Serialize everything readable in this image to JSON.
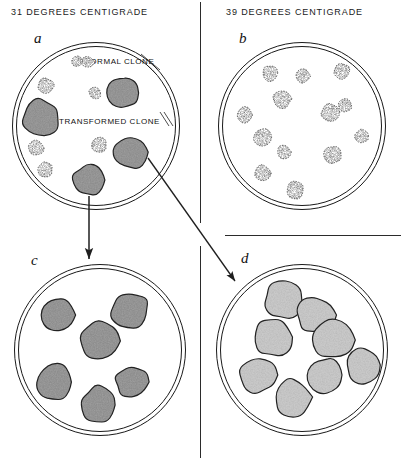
{
  "figure": {
    "type": "scientific-diagram",
    "headings": {
      "left": "31 DEGREES CENTIGRADE",
      "right": "39 DEGREES CENTIGRADE"
    },
    "labels": {
      "normal_clone": "NORMAL CLONE",
      "transformed_clone": "TRANSFORMED CLONE"
    },
    "colors": {
      "ink": "#1a1a1a",
      "background": "#ffffff",
      "colony_fill_dark": "#8d8d8d",
      "colony_fill_light": "#c9c9c9",
      "colony_outline": "#222222"
    },
    "panels": [
      {
        "id": "a",
        "letter": "a",
        "temperature": "31 DEGREES CENTIGRADE",
        "position": "top-left",
        "description": "Dish at permissive temperature containing both small normal clones and large dark transformed clones",
        "normal_clone_count": 6,
        "transformed_clone_count": 4,
        "colonies": [
          {
            "kind": "normal",
            "cx": 46,
            "cy": 86,
            "r": 8
          },
          {
            "kind": "normal",
            "cx": 95,
            "cy": 93,
            "r": 6
          },
          {
            "kind": "transformed",
            "cx": 122,
            "cy": 93,
            "r": 16
          },
          {
            "kind": "transformed",
            "cx": 41,
            "cy": 118,
            "r": 19
          },
          {
            "kind": "normal",
            "cx": 36,
            "cy": 148,
            "r": 8
          },
          {
            "kind": "normal",
            "cx": 99,
            "cy": 145,
            "r": 8
          },
          {
            "kind": "transformed",
            "cx": 131,
            "cy": 152,
            "r": 17
          },
          {
            "kind": "normal",
            "cx": 45,
            "cy": 170,
            "r": 8
          },
          {
            "kind": "transformed",
            "cx": 89,
            "cy": 180,
            "r": 16
          },
          {
            "kind": "normal",
            "cx": 88,
            "cy": 62,
            "r": 6
          }
        ]
      },
      {
        "id": "b",
        "letter": "b",
        "temperature": "39 DEGREES CENTIGRADE",
        "position": "top-right",
        "description": "Dish at non-permissive temperature containing only small normal clones; no transformed clones grow",
        "normal_clone_count": 13,
        "transformed_clone_count": 0,
        "colonies": [
          {
            "kind": "normal",
            "cx": 270,
            "cy": 73,
            "r": 8
          },
          {
            "kind": "normal",
            "cx": 303,
            "cy": 76,
            "r": 7
          },
          {
            "kind": "normal",
            "cx": 342,
            "cy": 71,
            "r": 8
          },
          {
            "kind": "normal",
            "cx": 282,
            "cy": 99,
            "r": 9
          },
          {
            "kind": "normal",
            "cx": 245,
            "cy": 115,
            "r": 8
          },
          {
            "kind": "normal",
            "cx": 330,
            "cy": 112,
            "r": 9
          },
          {
            "kind": "normal",
            "cx": 345,
            "cy": 105,
            "r": 7
          },
          {
            "kind": "normal",
            "cx": 262,
            "cy": 137,
            "r": 9
          },
          {
            "kind": "normal",
            "cx": 362,
            "cy": 136,
            "r": 7
          },
          {
            "kind": "normal",
            "cx": 284,
            "cy": 152,
            "r": 7
          },
          {
            "kind": "normal",
            "cx": 333,
            "cy": 155,
            "r": 9
          },
          {
            "kind": "normal",
            "cx": 263,
            "cy": 173,
            "r": 8
          },
          {
            "kind": "normal",
            "cx": 295,
            "cy": 190,
            "r": 9
          }
        ]
      },
      {
        "id": "c",
        "letter": "c",
        "temperature": "31 DEGREES CENTIGRADE",
        "position": "bottom-left",
        "description": "Subclone of a transformed colony re-plated at permissive temperature; all colonies are transformed",
        "normal_clone_count": 0,
        "transformed_clone_count": 6,
        "colonies": [
          {
            "kind": "transformed",
            "cx": 58,
            "cy": 315,
            "r": 17
          },
          {
            "kind": "transformed",
            "cx": 130,
            "cy": 310,
            "r": 19
          },
          {
            "kind": "transformed",
            "cx": 100,
            "cy": 341,
            "r": 20
          },
          {
            "kind": "transformed",
            "cx": 55,
            "cy": 382,
            "r": 19
          },
          {
            "kind": "transformed",
            "cx": 132,
            "cy": 382,
            "r": 17
          },
          {
            "kind": "transformed",
            "cx": 99,
            "cy": 405,
            "r": 19
          }
        ]
      },
      {
        "id": "d",
        "letter": "d",
        "temperature": "39 DEGREES CENTIGRADE",
        "position": "bottom-right",
        "description": "Subclone of a transformed colony re-plated at non-permissive temperature; colonies grow with normal morphology",
        "normal_clone_count": 0,
        "transformed_clone_count": 8,
        "colonies": [
          {
            "kind": "transformed-light",
            "cx": 283,
            "cy": 300,
            "r": 19
          },
          {
            "kind": "transformed-light",
            "cx": 315,
            "cy": 315,
            "r": 19
          },
          {
            "kind": "transformed-light",
            "cx": 273,
            "cy": 337,
            "r": 20
          },
          {
            "kind": "transformed-light",
            "cx": 333,
            "cy": 340,
            "r": 20
          },
          {
            "kind": "transformed-light",
            "cx": 363,
            "cy": 365,
            "r": 18
          },
          {
            "kind": "transformed-light",
            "cx": 258,
            "cy": 375,
            "r": 18
          },
          {
            "kind": "transformed-light",
            "cx": 325,
            "cy": 375,
            "r": 18
          },
          {
            "kind": "transformed-light",
            "cx": 292,
            "cy": 397,
            "r": 19
          }
        ]
      }
    ],
    "arrows": [
      {
        "name": "arrow-a-to-c",
        "from_panel": "a",
        "to_panel": "c",
        "direction": "down",
        "meaning": "transformed clone subcultured at 31 degrees"
      },
      {
        "name": "arrow-a-to-d",
        "from_panel": "a",
        "to_panel": "d",
        "direction": "diagonal-down-right",
        "meaning": "transformed clone subcultured at 39 degrees"
      }
    ],
    "dividers": [
      {
        "name": "vertical-divider",
        "orientation": "vertical"
      },
      {
        "name": "horizontal-divider",
        "orientation": "horizontal"
      }
    ]
  }
}
